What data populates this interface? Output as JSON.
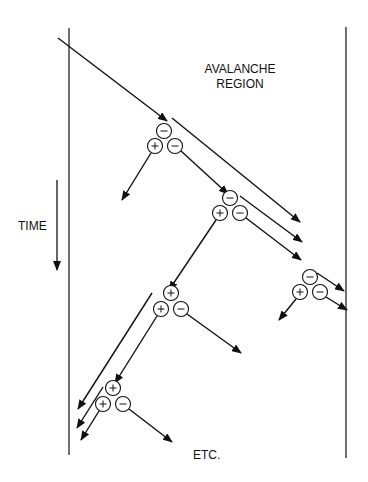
{
  "labels": {
    "region_line1": "AVALANCHE",
    "region_line2": "REGION",
    "time": "TIME",
    "etc": "ETC."
  },
  "colors": {
    "line": "#111111",
    "background": "#ffffff"
  },
  "borders": {
    "left": {
      "x": 69,
      "y1": 28,
      "y2": 455
    },
    "right": {
      "x": 346,
      "y1": 27,
      "y2": 458
    }
  },
  "time_arrow": {
    "x": 57,
    "y1": 180,
    "y2": 270
  },
  "clusters": [
    {
      "id": "c1",
      "particles": [
        {
          "x": 164,
          "y": 131,
          "charge": "−"
        },
        {
          "x": 155,
          "y": 146,
          "charge": "+"
        },
        {
          "x": 175,
          "y": 146,
          "charge": "−"
        }
      ]
    },
    {
      "id": "c2",
      "particles": [
        {
          "x": 230,
          "y": 198,
          "charge": "−"
        },
        {
          "x": 220,
          "y": 213,
          "charge": "+"
        },
        {
          "x": 240,
          "y": 213,
          "charge": "−"
        }
      ]
    },
    {
      "id": "c3",
      "particles": [
        {
          "x": 310,
          "y": 277,
          "charge": "−"
        },
        {
          "x": 300,
          "y": 292,
          "charge": "+"
        },
        {
          "x": 320,
          "y": 292,
          "charge": "−"
        }
      ]
    },
    {
      "id": "c4",
      "particles": [
        {
          "x": 171,
          "y": 293,
          "charge": "+"
        },
        {
          "x": 161,
          "y": 309,
          "charge": "+"
        },
        {
          "x": 181,
          "y": 309,
          "charge": "−"
        }
      ]
    },
    {
      "id": "c5",
      "particles": [
        {
          "x": 113,
          "y": 388,
          "charge": "+"
        },
        {
          "x": 103,
          "y": 404,
          "charge": "+"
        },
        {
          "x": 123,
          "y": 404,
          "charge": "−"
        }
      ]
    }
  ],
  "arrows": [
    {
      "x1": 58,
      "y1": 38,
      "x2": 167,
      "y2": 121,
      "head": true
    },
    {
      "x1": 172,
      "y1": 118,
      "x2": 300,
      "y2": 222,
      "head": true
    },
    {
      "x1": 151,
      "y1": 153,
      "x2": 122,
      "y2": 200,
      "head": true
    },
    {
      "x1": 181,
      "y1": 151,
      "x2": 228,
      "y2": 194,
      "head": true
    },
    {
      "x1": 240,
      "y1": 196,
      "x2": 302,
      "y2": 242,
      "head": true
    },
    {
      "x1": 246,
      "y1": 218,
      "x2": 301,
      "y2": 260,
      "head": true
    },
    {
      "x1": 216,
      "y1": 220,
      "x2": 169,
      "y2": 290,
      "head": true
    },
    {
      "x1": 317,
      "y1": 273,
      "x2": 344,
      "y2": 291,
      "head": true
    },
    {
      "x1": 326,
      "y1": 297,
      "x2": 347,
      "y2": 310,
      "head": true
    },
    {
      "x1": 296,
      "y1": 299,
      "x2": 279,
      "y2": 320,
      "head": true
    },
    {
      "x1": 187,
      "y1": 314,
      "x2": 241,
      "y2": 353,
      "head": true
    },
    {
      "x1": 157,
      "y1": 316,
      "x2": 115,
      "y2": 383,
      "head": true
    },
    {
      "x1": 152,
      "y1": 293,
      "x2": 78,
      "y2": 409,
      "head": true
    },
    {
      "x1": 103,
      "y1": 387,
      "x2": 77,
      "y2": 428,
      "head": true
    },
    {
      "x1": 129,
      "y1": 409,
      "x2": 172,
      "y2": 442,
      "head": true
    },
    {
      "x1": 99,
      "y1": 411,
      "x2": 81,
      "y2": 440,
      "head": true
    }
  ]
}
